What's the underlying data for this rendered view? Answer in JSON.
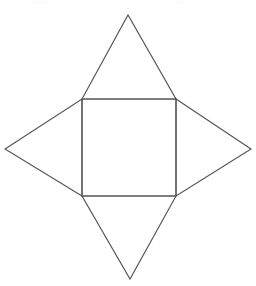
{
  "figure": {
    "background_color": "#ffffff",
    "stroke_color": "#555555",
    "stroke_width": 1.15,
    "canvas": {
      "width": 256,
      "height": 286
    }
  },
  "chart_data": {
    "type": "diagram",
    "shape": "four-pointed star",
    "square": {
      "name": "base-square",
      "points": [
        [
          82,
          99
        ],
        [
          176,
          99
        ],
        [
          176,
          196
        ],
        [
          82,
          196
        ]
      ],
      "side_length_px": 95
    },
    "triangles": [
      {
        "name": "top-triangle",
        "apex": [
          128,
          15
        ],
        "base": [
          [
            82,
            99
          ],
          [
            176,
            99
          ]
        ],
        "points": [
          [
            82,
            99
          ],
          [
            128,
            15
          ],
          [
            176,
            99
          ]
        ]
      },
      {
        "name": "right-triangle",
        "apex": [
          251,
          149
        ],
        "base": [
          [
            176,
            99
          ],
          [
            176,
            196
          ]
        ],
        "points": [
          [
            176,
            99
          ],
          [
            251,
            149
          ],
          [
            176,
            196
          ]
        ]
      },
      {
        "name": "bottom-triangle",
        "apex": [
          130,
          279
        ],
        "base": [
          [
            176,
            196
          ],
          [
            82,
            196
          ]
        ],
        "points": [
          [
            176,
            196
          ],
          [
            130,
            279
          ],
          [
            82,
            196
          ]
        ]
      },
      {
        "name": "left-triangle",
        "apex": [
          5,
          149
        ],
        "base": [
          [
            82,
            196
          ],
          [
            82,
            99
          ]
        ],
        "points": [
          [
            82,
            196
          ],
          [
            5,
            149
          ],
          [
            82,
            99
          ]
        ]
      }
    ],
    "outline_points": [
      [
        128,
        15
      ],
      [
        176,
        99
      ],
      [
        251,
        149
      ],
      [
        176,
        196
      ],
      [
        130,
        279
      ],
      [
        82,
        196
      ],
      [
        5,
        149
      ],
      [
        82,
        99
      ]
    ],
    "labels": [],
    "annotations": []
  },
  "artifacts": [
    {
      "name": "speck-left",
      "x": 28,
      "y": 1,
      "width": 22,
      "height": 3
    },
    {
      "name": "speck-right",
      "x": 172,
      "y": 1,
      "width": 18,
      "height": 3
    }
  ]
}
